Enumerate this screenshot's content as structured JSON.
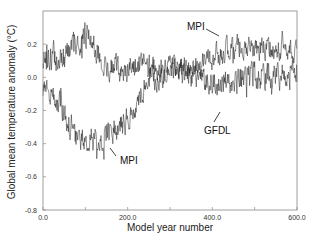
{
  "chart_data": {
    "type": "line",
    "title": "",
    "xlabel": "Model year number",
    "ylabel": "Global mean temperature anomaly (°C)",
    "xlim": [
      0,
      600
    ],
    "ylim": [
      -0.8,
      0.4
    ],
    "x_ticks": [
      0,
      200,
      400,
      600
    ],
    "x_tick_labels": [
      "0.0",
      "200.0",
      "400.0",
      "600.0"
    ],
    "y_ticks": [
      -0.8,
      -0.6,
      -0.4,
      -0.2,
      0.0,
      0.2
    ],
    "y_tick_labels": [
      "-0.8",
      "-0.6",
      "-0.4",
      "-0.2",
      "0.0",
      "0.2"
    ],
    "grid": false,
    "legend": "none (inline annotations)",
    "series": [
      {
        "name": "MPI",
        "description": "starts near -0.1, drops to about -0.4 around years 80-150, recovers to ~0.0 by year 250, then rises to ~0.15-0.2 for years 400-600",
        "trend_x": [
          0,
          40,
          70,
          100,
          150,
          200,
          250,
          300,
          350,
          400,
          450,
          500,
          550,
          600
        ],
        "trend_y": [
          -0.08,
          -0.15,
          -0.35,
          -0.4,
          -0.35,
          -0.25,
          -0.02,
          0.05,
          0.05,
          0.12,
          0.18,
          0.18,
          0.17,
          0.16
        ],
        "noise_amplitude": 0.07,
        "seed": 7
      },
      {
        "name": "GFDL",
        "description": "fluctuates around +0.1 to +0.25 early (peak ~0.35 near year 100), settles around 0.0 to +0.05 with dips to -0.2 for years 250-600",
        "trend_x": [
          0,
          50,
          100,
          150,
          200,
          250,
          300,
          350,
          400,
          450,
          500,
          550,
          600
        ],
        "trend_y": [
          0.12,
          0.12,
          0.25,
          0.08,
          0.05,
          0.05,
          0.05,
          0.02,
          -0.02,
          -0.03,
          0.0,
          0.02,
          0.02
        ],
        "noise_amplitude": 0.08,
        "seed": 13
      }
    ],
    "annotations": [
      {
        "text": "MPI",
        "x": 330,
        "y": 0.27,
        "points_to": "MPI upper (year ~410)"
      },
      {
        "text": "MPI",
        "x": 180,
        "y": -0.5,
        "points_to": "MPI trough (year ~160)"
      },
      {
        "text": "GFDL",
        "x": 385,
        "y": -0.33,
        "points_to": "GFDL (year ~420)"
      }
    ]
  },
  "labels": {
    "ylabel": "Global mean temperature anomaly (°C)",
    "xlabel": "Model year number",
    "ann_mpi_upper": "MPI",
    "ann_mpi_lower": "MPI",
    "ann_gfdl": "GFDL"
  },
  "colors": {
    "line": "#111111",
    "frame": "#777777",
    "text": "#222222"
  }
}
